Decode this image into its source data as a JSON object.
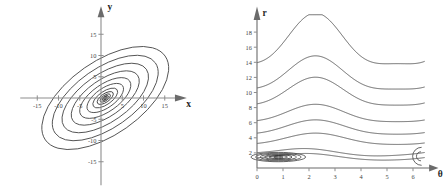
{
  "figure": {
    "background": "#ffffff",
    "curve_color": "#4a4a4a",
    "axis_color": "#8d8d8d"
  },
  "panels": [
    {
      "id": "left",
      "name": "xy-contour-plot",
      "axes": {
        "x_label": "x",
        "y_label": "y",
        "x_ticks": [
          "-15",
          "-10",
          "-5",
          "5",
          "10",
          "15"
        ],
        "x_tick_values": [
          -15,
          -10,
          -5,
          5,
          10,
          15
        ],
        "y_ticks": [
          "15",
          "10",
          "5",
          "-5",
          "-10",
          "-15"
        ],
        "y_tick_values": [
          15,
          10,
          5,
          -5,
          -10,
          -15
        ],
        "xlim": [
          -19,
          19
        ],
        "ylim": [
          -19,
          19
        ]
      }
    },
    {
      "id": "right",
      "name": "theta-r-contour-plot",
      "axes": {
        "x_label": "θ",
        "y_label": "r",
        "x_ticks": [
          "0",
          "1",
          "2",
          "3",
          "4",
          "5",
          "6"
        ],
        "x_tick_values": [
          0,
          1,
          2,
          3,
          4,
          5,
          6
        ],
        "y_ticks": [
          "0",
          "2",
          "4",
          "6",
          "8",
          "10",
          "12",
          "14",
          "16",
          "18"
        ],
        "y_tick_values": [
          0,
          2,
          4,
          6,
          8,
          10,
          12,
          14,
          16,
          18
        ],
        "xlim": [
          0,
          6.45
        ],
        "ylim": [
          0,
          20
        ]
      }
    }
  ],
  "chart_data": [
    {
      "type": "line",
      "name": "cartesian-contour-ellipses",
      "title": "",
      "xlabel": "x",
      "ylabel": "y",
      "xlim": [
        -19,
        19
      ],
      "ylim": [
        -19,
        19
      ],
      "grid": false,
      "legend": false,
      "description": "Nested rotated concentric ellipses (contour levels) centred slightly right of the origin, major axis tilted about -35 degrees from the x axis.",
      "center": [
        1.0,
        0.0
      ],
      "rotation_deg": -35,
      "ellipses": [
        {
          "semi_major": 17.2,
          "semi_minor": 8.6
        },
        {
          "semi_major": 14.4,
          "semi_minor": 7.0
        },
        {
          "semi_major": 11.8,
          "semi_minor": 5.6
        },
        {
          "semi_major": 9.3,
          "semi_minor": 4.3
        },
        {
          "semi_major": 7.0,
          "semi_minor": 3.2
        },
        {
          "semi_major": 5.0,
          "semi_minor": 2.3
        },
        {
          "semi_major": 3.4,
          "semi_minor": 1.55
        },
        {
          "semi_major": 2.2,
          "semi_minor": 1.0
        },
        {
          "semi_major": 1.4,
          "semi_minor": 0.64
        },
        {
          "semi_major": 0.85,
          "semi_minor": 0.39
        },
        {
          "semi_major": 0.5,
          "semi_minor": 0.23
        },
        {
          "semi_major": 0.28,
          "semi_minor": 0.13
        }
      ],
      "x_ticks": [
        -15,
        -10,
        -5,
        5,
        10,
        15
      ],
      "y_ticks": [
        15,
        10,
        5,
        -5,
        -10,
        -15
      ]
    },
    {
      "type": "line",
      "name": "polar-unrolled-contours",
      "title": "",
      "xlabel": "θ",
      "ylabel": "r",
      "xlim": [
        0,
        6.45
      ],
      "ylim": [
        0,
        20
      ],
      "grid": false,
      "legend": false,
      "description": "Contours of the same field unrolled in polar coordinates: each level is a 2-pi periodic wave in theta, with crests near theta = 2.2 and theta = 5.6 and troughs near theta = 0.9 and theta = 3.9. Levels flatten and shrink toward a closed loop near theta = 0.8, r = 1.5.",
      "x_ticks": [
        0,
        1,
        2,
        3,
        4,
        5,
        6
      ],
      "y_ticks": [
        0,
        2,
        4,
        6,
        8,
        10,
        12,
        14,
        16,
        18
      ],
      "series": [
        {
          "name": "level-1",
          "r_at_theta0": 15.5,
          "r_crest": 19.6,
          "r_trough": 12.9
        },
        {
          "name": "level-2",
          "r_at_theta0": 11.5,
          "r_crest": 14.3,
          "r_trough": 9.9
        },
        {
          "name": "level-3",
          "r_at_theta0": 9.4,
          "r_crest": 11.6,
          "r_trough": 7.9
        },
        {
          "name": "level-4",
          "r_at_theta0": 7.5,
          "r_crest": 8.2,
          "r_trough": 5.9
        },
        {
          "name": "level-5",
          "r_at_theta0": 6.0,
          "r_crest": 6.2,
          "r_trough": 4.3
        },
        {
          "name": "level-6",
          "r_at_theta0": 4.4,
          "r_crest": 4.5,
          "r_trough": 3.0
        },
        {
          "name": "level-7",
          "r_at_theta0": 3.2,
          "r_crest": 3.2,
          "r_trough": 1.9
        },
        {
          "name": "level-8",
          "r_at_theta0": 2.5,
          "r_crest": 2.4,
          "r_trough": 1.2
        }
      ],
      "closed_loops": {
        "center": [
          0.82,
          1.45
        ],
        "count": 6,
        "max_half_width": 1.05,
        "max_half_height": 0.62
      }
    }
  ]
}
